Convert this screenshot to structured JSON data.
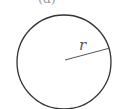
{
  "diagram": {
    "caption_partial": "(a)",
    "shape": "circle",
    "radius_label": "r",
    "colors": {
      "stroke": "#333333",
      "radius_line": "#555555",
      "label": "#555555"
    }
  }
}
